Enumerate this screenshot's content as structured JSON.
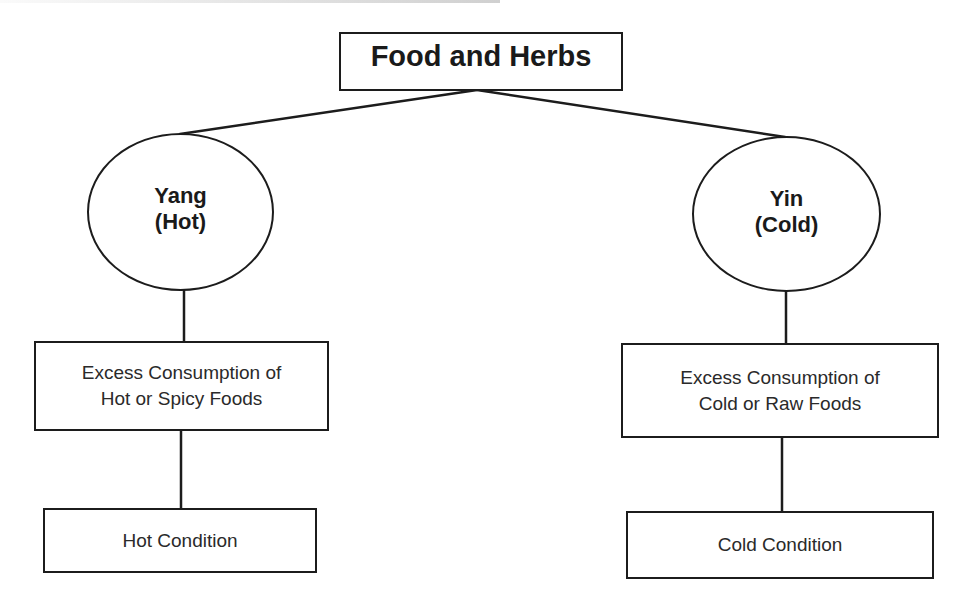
{
  "diagram": {
    "type": "tree",
    "root": {
      "label": "Food and Herbs"
    },
    "branches": [
      {
        "id": "yang",
        "node": {
          "line1": "Yang",
          "line2": "(Hot)"
        },
        "cause": {
          "line1": "Excess Consumption of",
          "line2": "Hot or Spicy Foods"
        },
        "result": {
          "label": "Hot Condition"
        }
      },
      {
        "id": "yin",
        "node": {
          "line1": "Yin",
          "line2": "(Cold)"
        },
        "cause": {
          "line1": "Excess Consumption of",
          "line2": "Cold or Raw Foods"
        },
        "result": {
          "label": "Cold Condition"
        }
      }
    ],
    "edges": [
      {
        "from": "Food and Herbs",
        "to": "Yang (Hot)"
      },
      {
        "from": "Food and Herbs",
        "to": "Yin (Cold)"
      },
      {
        "from": "Yang (Hot)",
        "to": "Excess Consumption of Hot or Spicy Foods"
      },
      {
        "from": "Excess Consumption of Hot or Spicy Foods",
        "to": "Hot Condition"
      },
      {
        "from": "Yin (Cold)",
        "to": "Excess Consumption of Cold or Raw Foods"
      },
      {
        "from": "Excess Consumption of Cold or Raw Foods",
        "to": "Cold Condition"
      }
    ]
  },
  "colors": {
    "stroke": "#1c1c1c",
    "background": "#ffffff",
    "text": "#1a1a1a"
  }
}
